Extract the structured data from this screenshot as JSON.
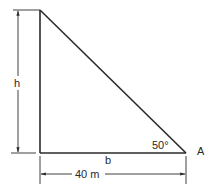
{
  "diagram": {
    "type": "right-triangle-dimensioned",
    "labels": {
      "height": "h",
      "base": "b",
      "angle": "50°",
      "vertex": "A",
      "base_dimension": "40 m"
    },
    "colors": {
      "stroke": "#2a2a2a",
      "background": "#ffffff"
    }
  }
}
